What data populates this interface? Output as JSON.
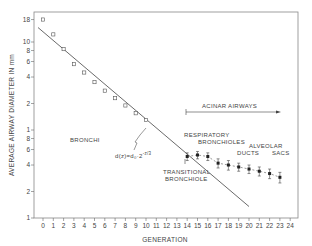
{
  "chart_data": {
    "type": "scatter",
    "title": "",
    "xlabel": "GENERATION",
    "ylabel": "AVERAGE AIRWAY DIAMETER IN mm",
    "xlim": [
      -1,
      24.5
    ],
    "ylim": [
      0.1,
      20
    ],
    "yscale": "log",
    "grid": false,
    "x_ticks": [
      0,
      1,
      2,
      3,
      4,
      5,
      6,
      7,
      8,
      9,
      10,
      11,
      12,
      13,
      14,
      15,
      16,
      17,
      18,
      19,
      20,
      21,
      22,
      23,
      24
    ],
    "y_ticks": [
      {
        "value": 18,
        "label": "18"
      },
      {
        "value": 10,
        "label": "10"
      },
      {
        "value": 8,
        "label": "8"
      },
      {
        "value": 6,
        "label": "6"
      },
      {
        "value": 4,
        "label": "4"
      },
      {
        "value": 2,
        "label": "2"
      },
      {
        "value": 1,
        "label": "1"
      },
      {
        "value": 0.8,
        "label": "8"
      },
      {
        "value": 0.6,
        "label": "6"
      },
      {
        "value": 0.4,
        "label": "4"
      },
      {
        "value": 0.2,
        "label": "2"
      },
      {
        "value": 0.1,
        "label": "1"
      }
    ],
    "series": [
      {
        "name": "Bronchi (measured)",
        "marker": "open-square",
        "x": [
          0,
          1,
          2,
          3,
          4,
          5,
          6,
          7,
          8,
          9,
          10
        ],
        "y": [
          18,
          12.2,
          8.3,
          5.6,
          4.5,
          3.5,
          2.8,
          2.3,
          1.9,
          1.55,
          1.3
        ]
      },
      {
        "name": "Acinar airways (measured, with error bars)",
        "marker": "filled-square",
        "line": "dashed",
        "x": [
          14,
          15,
          16,
          17,
          18,
          19,
          20,
          21,
          22,
          23
        ],
        "y": [
          0.5,
          0.52,
          0.5,
          0.42,
          0.4,
          0.38,
          0.36,
          0.34,
          0.32,
          0.29
        ],
        "err": [
          0.05,
          0.05,
          0.05,
          0.05,
          0.05,
          0.04,
          0.04,
          0.04,
          0.04,
          0.04
        ]
      },
      {
        "name": "Model fit d(z)=d0·2^(-z/3)",
        "type": "line",
        "x": [
          0,
          20
        ],
        "y": [
          13.5,
          0.135
        ]
      }
    ],
    "annotations": [
      {
        "text": "BRONCHI",
        "x": 6,
        "y": 0.75
      },
      {
        "text": "d(z)=d₀·2",
        "sup": "-z/3",
        "x": 11.5,
        "y": 0.5
      },
      {
        "text": "ACINAR AIRWAYS",
        "x": 17.5,
        "y": 1.15,
        "arrow": "right",
        "from_x": 14,
        "to_x": 23
      },
      {
        "text": "RESPIRATORY",
        "x": 15.5,
        "y": 0.85
      },
      {
        "text": "BRONCHIOLES",
        "x": 17,
        "y": 0.73
      },
      {
        "text": "ALVEOLAR",
        "x": 21,
        "y": 0.62
      },
      {
        "text": "DUCTS",
        "x": 19,
        "y": 0.55
      },
      {
        "text": "SACS",
        "x": 23,
        "y": 0.55
      },
      {
        "text": "TRANSITIONAL",
        "x": 15.5,
        "y": 0.32
      },
      {
        "text": "BRONCHIOLE",
        "x": 15.5,
        "y": 0.27
      }
    ]
  },
  "labels": {
    "xlabel": "GENERATION",
    "ylabel": "AVERAGE AIRWAY DIAMETER IN mm",
    "bronchi": "BRONCHI",
    "formula_main": "d(z)=d₀·2",
    "formula_exp": "-z/3",
    "acinar": "ACINAR AIRWAYS",
    "resp1": "RESPIRATORY",
    "resp2": "BRONCHIOLES",
    "alveolar": "ALVEOLAR",
    "ducts": "DUCTS",
    "sacs": "SACS",
    "trans1": "TRANSITIONAL",
    "trans2": "BRONCHIOLE"
  }
}
